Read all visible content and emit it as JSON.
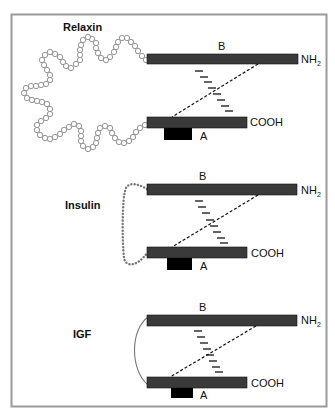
{
  "colors": {
    "border": "#9a9a9a",
    "chain_bar": "#3a3a3a",
    "a_box": "#000000",
    "residue_circle": "#8a8a8a",
    "insulin_loop": "#777777",
    "igf_arc": "#777777"
  },
  "panels": [
    {
      "name": "Relaxin",
      "chain_b_label": "B",
      "chain_a_label": "A",
      "b_terminus": "NH",
      "b_terminus_sub": "2",
      "a_terminus": "COOH",
      "connector": "circle-chain"
    },
    {
      "name": "Insulin",
      "chain_b_label": "B",
      "chain_a_label": "A",
      "b_terminus": "NH",
      "b_terminus_sub": "2",
      "a_terminus": "COOH",
      "connector": "dotted-loop"
    },
    {
      "name": "IGF",
      "chain_b_label": "B",
      "chain_a_label": "A",
      "b_terminus": "NH",
      "b_terminus_sub": "2",
      "a_terminus": "COOH",
      "connector": "arc"
    }
  ]
}
